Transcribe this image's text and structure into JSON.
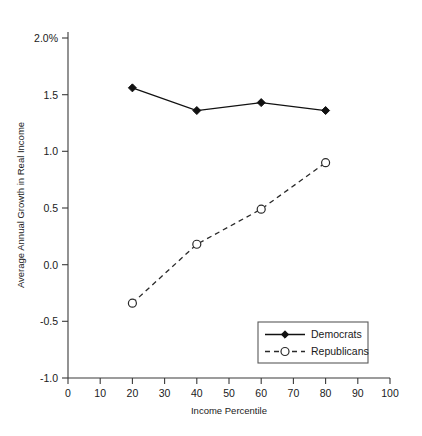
{
  "chart_data": {
    "type": "line",
    "title": "",
    "xlabel": "Income Percentile",
    "ylabel": "Average Annual Growth in Real Income",
    "xlim": [
      0,
      100
    ],
    "ylim": [
      -1.0,
      2.0
    ],
    "grid": false,
    "legend_position": "bottom-right",
    "x": [
      20,
      40,
      60,
      80
    ],
    "xticks": [
      "0",
      "10",
      "20",
      "30",
      "40",
      "50",
      "60",
      "70",
      "80",
      "90",
      "100"
    ],
    "xtick_values": [
      0,
      10,
      20,
      30,
      40,
      50,
      60,
      70,
      80,
      90,
      100
    ],
    "yticks": [
      "2.0%",
      "1.5",
      "1.0",
      "0.5",
      "0.0",
      "-0.5",
      "-1.0"
    ],
    "ytick_values": [
      2.0,
      1.5,
      1.0,
      0.5,
      0.0,
      -0.5,
      -1.0
    ],
    "series": [
      {
        "name": "Democrats",
        "values": [
          1.56,
          1.36,
          1.43,
          1.36
        ],
        "line_style": "solid",
        "marker": "filled-diamond",
        "color": "#111111"
      },
      {
        "name": "Republicans",
        "values": [
          -0.34,
          0.18,
          0.49,
          0.9
        ],
        "line_style": "dashed",
        "marker": "open-circle",
        "color": "#2a2a2a"
      }
    ]
  },
  "legend": {
    "entries": [
      {
        "label": "Democrats"
      },
      {
        "label": "Republicans"
      }
    ]
  }
}
